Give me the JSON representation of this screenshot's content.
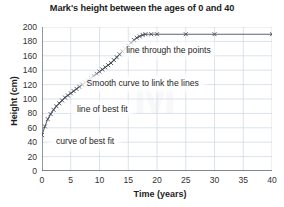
{
  "chart_data": {
    "type": "line",
    "title": "Mark's height between the ages of 0 and 40",
    "xlabel": "Time (years)",
    "ylabel": "Height (cm)",
    "xlim": [
      0,
      40
    ],
    "ylim": [
      0,
      200
    ],
    "xticks": [
      0,
      5,
      10,
      15,
      20,
      25,
      30,
      35,
      40
    ],
    "yticks": [
      0,
      20,
      40,
      60,
      80,
      100,
      120,
      140,
      160,
      180,
      200
    ],
    "grid": true,
    "legend": "none",
    "marker": "x",
    "series": [
      {
        "name": "Mark's height",
        "x": [
          0,
          0.5,
          1,
          1.5,
          2,
          2.5,
          3,
          3.5,
          4,
          4.5,
          5,
          5.5,
          6,
          6.5,
          7,
          7.5,
          8,
          8.5,
          9,
          9.5,
          10,
          10.5,
          11,
          11.5,
          12,
          12.5,
          13,
          13.5,
          14,
          14.5,
          15,
          15.5,
          16,
          16.5,
          17,
          17.5,
          18,
          19,
          20,
          25,
          30,
          40
        ],
        "y": [
          50,
          62,
          72,
          79,
          85,
          90,
          94,
          98,
          102,
          105,
          108,
          111,
          114,
          117,
          120,
          123,
          126,
          129,
          132,
          135,
          138,
          141,
          144,
          147,
          150,
          154,
          158,
          162,
          166,
          170,
          174,
          178,
          182,
          185,
          187,
          189,
          190,
          190,
          190,
          190,
          190,
          190
        ]
      }
    ],
    "annotations": [
      {
        "text": "line through the points",
        "x": 22.0,
        "y": 168
      },
      {
        "text": "Smooth curve to link the lines",
        "x": 17.5,
        "y": 122
      },
      {
        "text": "line of best fit",
        "x": 10.5,
        "y": 86
      },
      {
        "text": "curve of best fit",
        "x": 7.5,
        "y": 42
      }
    ]
  },
  "style": {
    "axis_color": "#555f6b",
    "grid_color": "#d2dae4",
    "line_color": "#5a6472",
    "marker_color": "#3c4450",
    "background": "#ffffff",
    "watermark_text": "M"
  }
}
